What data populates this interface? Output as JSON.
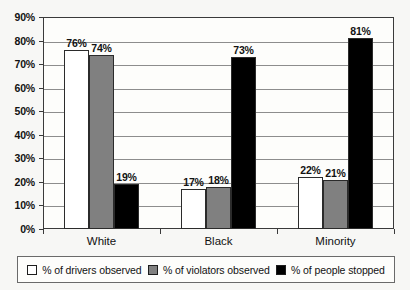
{
  "chart_data": {
    "type": "bar",
    "title": "",
    "xlabel": "",
    "ylabel": "",
    "ylim": [
      0,
      90
    ],
    "ytick_labels": [
      "0%",
      "10%",
      "20%",
      "30%",
      "40%",
      "50%",
      "60%",
      "70%",
      "80%",
      "90%"
    ],
    "yticks": [
      0,
      10,
      20,
      30,
      40,
      50,
      60,
      70,
      80,
      90
    ],
    "grid": true,
    "legend_position": "bottom",
    "categories": [
      "White",
      "Black",
      "Minority"
    ],
    "series": [
      {
        "name": "% of drivers observed",
        "color": "#ffffff",
        "values": [
          76,
          17,
          22
        ],
        "labels": [
          "76%",
          "17%",
          "22%"
        ]
      },
      {
        "name": "% of violators observed",
        "color": "#808080",
        "values": [
          74,
          18,
          21
        ],
        "labels": [
          "74%",
          "18%",
          "21%"
        ]
      },
      {
        "name": "% of people stopped",
        "color": "#000000",
        "values": [
          19,
          73,
          81
        ],
        "labels": [
          "19%",
          "73%",
          "81%"
        ]
      }
    ]
  },
  "legend": {
    "items": [
      {
        "label": "% of drivers observed",
        "color": "#ffffff"
      },
      {
        "label": "% of violators observed",
        "color": "#808080"
      },
      {
        "label": "% of people stopped",
        "color": "#000000"
      }
    ]
  }
}
